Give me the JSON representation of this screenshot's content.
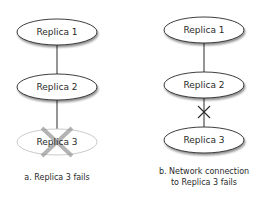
{
  "diagram_a": {
    "nodes": [
      {
        "label": "Replica 1",
        "state": "normal"
      },
      {
        "label": "Replica 2",
        "state": "normal"
      },
      {
        "label": "Replica 3",
        "state": "failed"
      }
    ],
    "caption": "a. Replica 3 fails",
    "failure_marker": "x-over-node"
  },
  "diagram_b": {
    "nodes": [
      {
        "label": "Replica 1",
        "state": "normal"
      },
      {
        "label": "Replica 2",
        "state": "normal"
      },
      {
        "label": "Replica 3",
        "state": "normal"
      }
    ],
    "caption_line1": "b. Network connection",
    "caption_line2": "to Replica 3 fails",
    "failure_marker": "x-on-link"
  },
  "colors": {
    "stroke": "#2a2a2a",
    "node_fill": "#ffffff",
    "failed_stroke": "#b5b5b5",
    "failed_x": "#9a9a9a",
    "text": "#2a2a2a"
  }
}
